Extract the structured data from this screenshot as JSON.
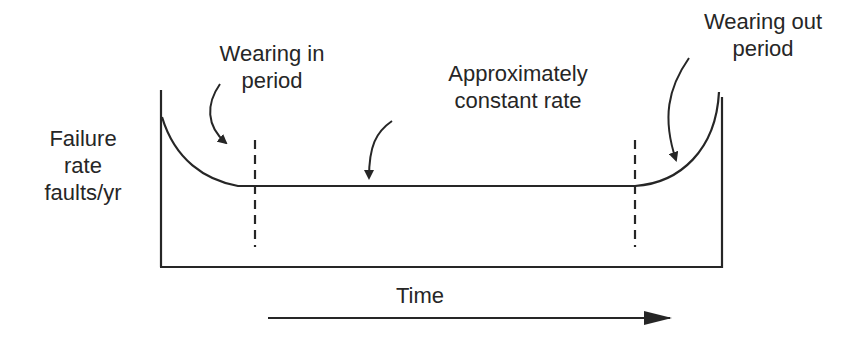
{
  "diagram": {
    "type": "bathtub-curve",
    "y_axis_label": {
      "line1": "Failure",
      "line2": "rate",
      "line3": "faults/yr"
    },
    "x_axis_label": "Time",
    "annotations": {
      "wearing_in": {
        "line1": "Wearing in",
        "line2": "period"
      },
      "constant": {
        "line1": "Approximately",
        "line2": "constant rate"
      },
      "wearing_out": {
        "line1": "Wearing out",
        "line2": "period"
      }
    },
    "regions": [
      {
        "name": "Wearing in period",
        "behavior": "decreasing failure rate"
      },
      {
        "name": "Approximately constant rate",
        "behavior": "constant failure rate"
      },
      {
        "name": "Wearing out period",
        "behavior": "increasing failure rate"
      }
    ],
    "colors": {
      "stroke": "#262626",
      "background": "#ffffff"
    }
  }
}
